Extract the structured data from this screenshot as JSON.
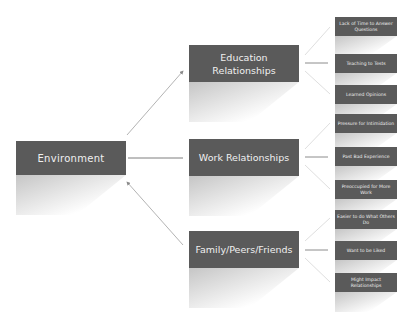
{
  "diagram": {
    "root": {
      "label": "Environment"
    },
    "branches": [
      {
        "label": "Education Relationships",
        "leaves": [
          "Lack of Time to Answer Questions",
          "Teaching to Tests",
          "Learned Opinions"
        ]
      },
      {
        "label": "Work Relationships",
        "leaves": [
          "Pressure for Intimidation",
          "Past Bad Experience",
          "Preoccupied for More Work"
        ]
      },
      {
        "label": "Family/Peers/Friends",
        "leaves": [
          "Easier to do What Others Do",
          "Want to be Liked",
          "Might Impact Relationships"
        ]
      }
    ],
    "colors": {
      "box": "#5a5a5a",
      "text": "#f0f0f0",
      "connector": "#9a9a9a"
    }
  }
}
